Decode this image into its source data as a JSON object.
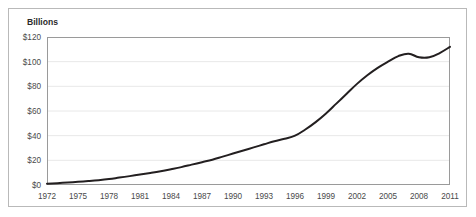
{
  "chart_data": {
    "type": "line",
    "title": "",
    "subtitle": "",
    "unit_label": "Billions",
    "xlabel": "",
    "ylabel": "",
    "xlim": [
      1972,
      2011
    ],
    "ylim": [
      0,
      120
    ],
    "grid": true,
    "legend": "none",
    "x_tick_labels": [
      "1972",
      "1975",
      "1978",
      "1981",
      "1984",
      "1987",
      "1990",
      "1993",
      "1996",
      "1999",
      "2002",
      "2005",
      "2008",
      "2011"
    ],
    "x_tick_values": [
      1972,
      1975,
      1978,
      1981,
      1984,
      1987,
      1990,
      1993,
      1996,
      1999,
      2002,
      2005,
      2008,
      2011
    ],
    "y_tick_labels": [
      "$0",
      "$20",
      "$40",
      "$60",
      "$80",
      "$100",
      "$120"
    ],
    "y_tick_values": [
      0,
      20,
      40,
      60,
      80,
      100,
      120
    ],
    "line_color": "#231f20",
    "grid_color": "#e8e8e8",
    "axis_color": "#9a9a9a",
    "x": [
      1972,
      1973,
      1974,
      1975,
      1976,
      1977,
      1978,
      1979,
      1980,
      1981,
      1982,
      1983,
      1984,
      1985,
      1986,
      1987,
      1988,
      1989,
      1990,
      1991,
      1992,
      1993,
      1994,
      1995,
      1996,
      1997,
      1998,
      1999,
      2000,
      2001,
      2002,
      2003,
      2004,
      2005,
      2006,
      2007,
      2008,
      2009,
      2010,
      2011
    ],
    "values": [
      1.0,
      1.5,
      2.0,
      2.6,
      3.2,
      3.9,
      4.8,
      6.0,
      7.2,
      8.5,
      9.8,
      11.2,
      12.8,
      14.5,
      16.5,
      18.5,
      20.5,
      23.0,
      25.5,
      28.0,
      30.5,
      33.0,
      35.5,
      37.5,
      40.0,
      45.0,
      51.0,
      58.0,
      66.0,
      74.0,
      82.0,
      89.0,
      95.0,
      100.0,
      104.5,
      106.5,
      103.5,
      103.5,
      107.0,
      112.0
    ],
    "series": [
      {
        "name": "value",
        "values": [
          1.0,
          1.5,
          2.0,
          2.6,
          3.2,
          3.9,
          4.8,
          6.0,
          7.2,
          8.5,
          9.8,
          11.2,
          12.8,
          14.5,
          16.5,
          18.5,
          20.5,
          23.0,
          25.5,
          28.0,
          30.5,
          33.0,
          35.5,
          37.5,
          40.0,
          45.0,
          51.0,
          58.0,
          66.0,
          74.0,
          82.0,
          89.0,
          95.0,
          100.0,
          104.5,
          106.5,
          103.5,
          103.5,
          107.0,
          112.0
        ]
      }
    ]
  }
}
